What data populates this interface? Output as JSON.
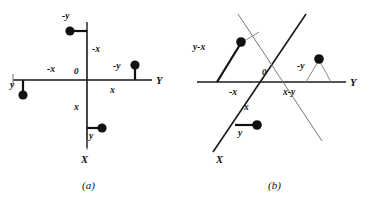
{
  "figure": {
    "panels": [
      {
        "id": "a",
        "caption": "(a)",
        "axes": {
          "horizontal_label": "Y",
          "vertical_label": "X"
        },
        "origin_label": "0",
        "labels": {
          "top_dot": "-y",
          "upper_vertical": "-x",
          "left_horizontal": "-x",
          "left_dot": "y",
          "right_dot": "-y",
          "right_horizontal": "x",
          "lower_vertical": "x",
          "bottom_dot": "y"
        }
      },
      {
        "id": "b",
        "caption": "(b)",
        "axes": {
          "horizontal_label": "Y",
          "oblique_label": "X"
        },
        "origin_label": "0",
        "labels": {
          "upper_left_vector": "y-x",
          "left_horizontal": "-x",
          "right_horizontal": "x-y",
          "right_dot": "-y",
          "lower_oblique": "x",
          "bottom_dot": "y"
        }
      }
    ]
  },
  "colors": {
    "ink": "#111111",
    "axis": "#1a1a1a",
    "thin": "#8a8a8a",
    "background": "#ffffff"
  }
}
